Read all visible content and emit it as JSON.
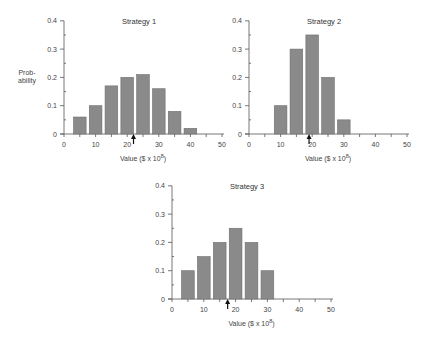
{
  "figure": {
    "ylabel_line1": "Prob-",
    "ylabel_line2": "ability"
  },
  "chart_data": [
    {
      "type": "bar",
      "title": "Strategy 1",
      "xlabel": "Value ($ x 10^8)",
      "ylabel": "Probability",
      "x": [
        5,
        10,
        15,
        20,
        25,
        30,
        35,
        40
      ],
      "values": [
        0.06,
        0.1,
        0.17,
        0.2,
        0.21,
        0.16,
        0.08,
        0.02
      ],
      "xlim": [
        0,
        50
      ],
      "ylim": [
        0,
        0.4
      ],
      "xticks": [
        0,
        10,
        20,
        30,
        40,
        50
      ],
      "yticks": [
        0,
        0.1,
        0.2,
        0.3,
        0.4
      ],
      "ytick_labels": [
        "0",
        "0.1",
        "0.2",
        "0.3",
        "0.4"
      ],
      "annotation": {
        "type": "arrow",
        "x": 22,
        "label": "expected value"
      },
      "grid": false
    },
    {
      "type": "bar",
      "title": "Strategy 2",
      "xlabel": "Value ($ x 10^8)",
      "ylabel": "",
      "x": [
        10,
        15,
        20,
        25,
        30
      ],
      "values": [
        0.1,
        0.3,
        0.35,
        0.2,
        0.05
      ],
      "xlim": [
        0,
        50
      ],
      "ylim": [
        0,
        0.4
      ],
      "xticks": [
        0,
        10,
        20,
        30,
        40,
        50
      ],
      "yticks": [
        0,
        0.1,
        0.2,
        0.3,
        0.4
      ],
      "ytick_labels": [
        "0",
        "0.1",
        "0.2",
        "0.3",
        "0.4"
      ],
      "annotation": {
        "type": "arrow",
        "x": 19,
        "label": "expected value"
      },
      "grid": false
    },
    {
      "type": "bar",
      "title": "Strategy 3",
      "xlabel": "Value ($ x 10^8)",
      "ylabel": "",
      "x": [
        5,
        10,
        15,
        20,
        25,
        30
      ],
      "values": [
        0.1,
        0.15,
        0.2,
        0.25,
        0.2,
        0.1
      ],
      "xlim": [
        0,
        50
      ],
      "ylim": [
        0,
        0.4
      ],
      "xticks": [
        0,
        10,
        20,
        30,
        40,
        50
      ],
      "yticks": [
        0,
        0.1,
        0.2,
        0.3,
        0.4
      ],
      "ytick_labels": [
        "0",
        "0.1",
        "0.2",
        "0.3",
        "0.4"
      ],
      "annotation": {
        "type": "arrow",
        "x": 17.5,
        "label": "expected value"
      },
      "grid": false
    }
  ],
  "layout": [
    {
      "x0": 64,
      "y0": 134,
      "xscale": 3.16,
      "yscale": 283
    },
    {
      "x0": 249,
      "y0": 134,
      "xscale": 3.16,
      "yscale": 283
    },
    {
      "x0": 172,
      "y0": 299,
      "xscale": 3.18,
      "yscale": 283
    }
  ],
  "colors": {
    "bar": "#8a8a8a",
    "bar_edge": "#6e6e6e",
    "axis": "#555555",
    "arrow": "#111111"
  }
}
